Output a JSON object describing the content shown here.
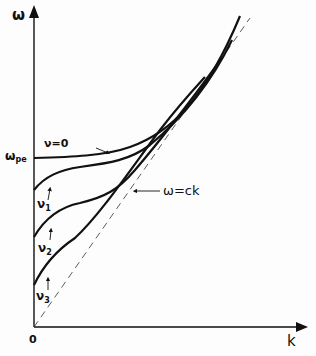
{
  "diagram": {
    "axes": {
      "y_label": "ω",
      "x_label": "k",
      "origin_label": "0",
      "y_tick_label": "ω",
      "y_tick_sub": "pe"
    },
    "curves": [
      {
        "name": "nu0",
        "label": "ν = 0",
        "label_text": "ν=0"
      },
      {
        "name": "nu1",
        "label": "ν",
        "sub": "1"
      },
      {
        "name": "nu2",
        "label": "ν",
        "sub": "2"
      },
      {
        "name": "nu3",
        "label": "ν",
        "sub": "3"
      }
    ],
    "light_line": {
      "label": "ω=ck",
      "style": "dashed"
    },
    "colors": {
      "ink": "#111111",
      "background": "#fdfdfd"
    }
  }
}
